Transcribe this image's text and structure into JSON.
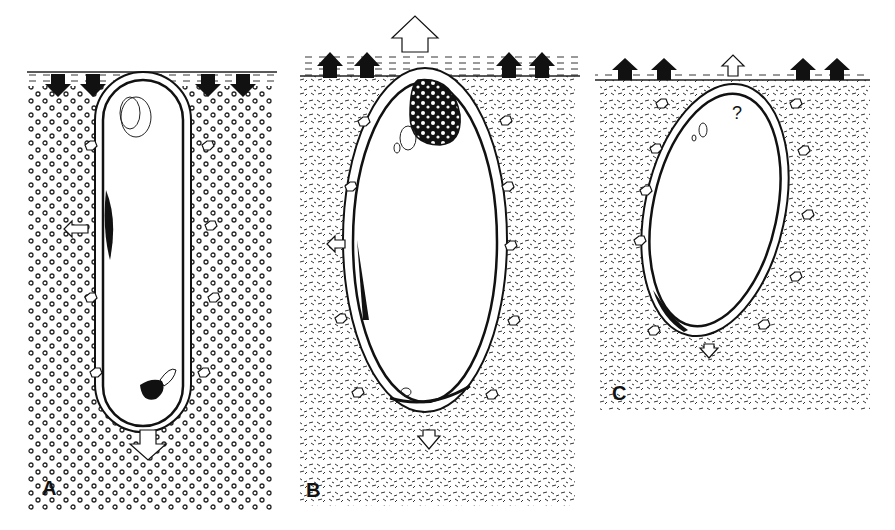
{
  "figure": {
    "panels": [
      {
        "id": "A",
        "label": "A",
        "sediment": "coarse-circles",
        "surface_arrows": "down",
        "cell_arrow": "down"
      },
      {
        "id": "B",
        "label": "B",
        "sediment": "fine-flecks",
        "surface_arrows": "up",
        "cell_arrow": "up"
      },
      {
        "id": "C",
        "label": "C",
        "sediment": "fine-flecks",
        "surface_arrows": "up",
        "cell_arrow": "up",
        "annotation": "?"
      }
    ]
  },
  "colors": {
    "ink": "#111111",
    "paper": "#ffffff"
  }
}
